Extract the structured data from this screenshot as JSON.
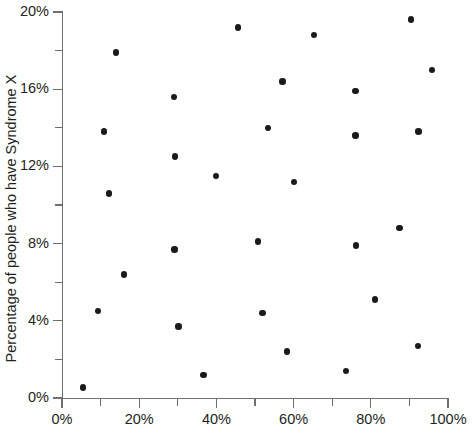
{
  "chart_data": {
    "type": "scatter",
    "title": "",
    "subtitle": "",
    "xlabel": "",
    "ylabel": "Percentage of people who have Syndrome X",
    "xlim": [
      0,
      100
    ],
    "ylim": [
      0,
      20
    ],
    "grid": false,
    "legend": null,
    "x_tick_labels": [
      "0%",
      "20%",
      "40%",
      "60%",
      "80%",
      "100%"
    ],
    "x_tick_values": [
      0,
      20,
      40,
      60,
      80,
      100
    ],
    "x_minor_tick_values": [
      10,
      30,
      50,
      70,
      90
    ],
    "y_tick_labels": [
      "0%",
      "4%",
      "8%",
      "12%",
      "16%",
      "20%"
    ],
    "y_tick_values": [
      0,
      4,
      8,
      12,
      16,
      20
    ],
    "y_minor_tick_values": [
      2,
      6,
      10,
      14,
      18
    ],
    "x_unit": "%",
    "y_unit": "%",
    "marker": "filled-circle",
    "marker_color": "#1a1a1a",
    "axis_color": "#6f6f6f",
    "background_color": "#ffffff",
    "point_count": 29,
    "points": [
      {
        "x": 5.4,
        "y": 0.55
      },
      {
        "x": 9.3,
        "y": 4.5
      },
      {
        "x": 10.9,
        "y": 13.8
      },
      {
        "x": 12.2,
        "y": 10.6
      },
      {
        "x": 14.0,
        "y": 17.9
      },
      {
        "x": 16.1,
        "y": 6.4
      },
      {
        "x": 29.0,
        "y": 15.6
      },
      {
        "x": 29.3,
        "y": 12.5
      },
      {
        "x": 29.2,
        "y": 7.7
      },
      {
        "x": 30.2,
        "y": 3.7
      },
      {
        "x": 36.6,
        "y": 1.2
      },
      {
        "x": 39.9,
        "y": 11.5
      },
      {
        "x": 45.6,
        "y": 19.2
      },
      {
        "x": 50.8,
        "y": 8.1
      },
      {
        "x": 51.9,
        "y": 4.4
      },
      {
        "x": 53.4,
        "y": 14.0
      },
      {
        "x": 57.2,
        "y": 16.4
      },
      {
        "x": 58.3,
        "y": 2.4
      },
      {
        "x": 60.1,
        "y": 11.2
      },
      {
        "x": 65.3,
        "y": 18.8
      },
      {
        "x": 73.6,
        "y": 1.4
      },
      {
        "x": 76.0,
        "y": 15.9
      },
      {
        "x": 76.2,
        "y": 7.9
      },
      {
        "x": 76.1,
        "y": 13.6
      },
      {
        "x": 81.1,
        "y": 5.1
      },
      {
        "x": 87.5,
        "y": 8.8
      },
      {
        "x": 90.4,
        "y": 19.6
      },
      {
        "x": 92.3,
        "y": 13.8
      },
      {
        "x": 92.2,
        "y": 2.7
      },
      {
        "x": 95.9,
        "y": 17.0
      }
    ]
  }
}
